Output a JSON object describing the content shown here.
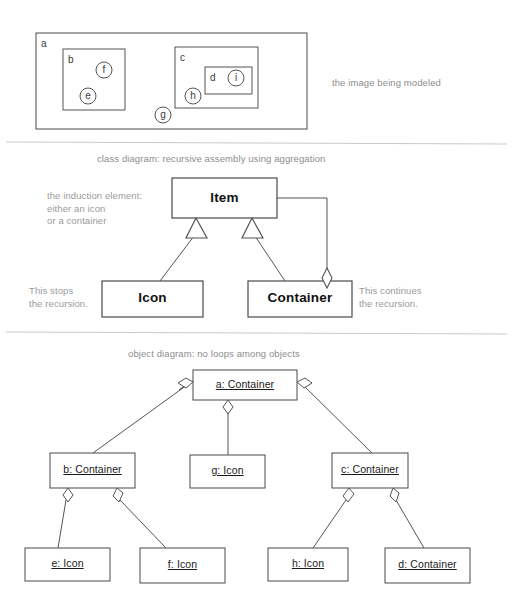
{
  "figure": {
    "background_color": "#ffffff",
    "line_color": "#4a4a4a",
    "caption_color": "#8d8d8d"
  },
  "panel_image": {
    "caption": "the image being modeled",
    "outer_box_label": "a",
    "boxes": [
      {
        "label": "a",
        "x": 36,
        "y": 33,
        "w": 271,
        "h": 96
      },
      {
        "label": "b",
        "x": 63,
        "y": 49,
        "w": 62,
        "h": 61
      },
      {
        "label": "c",
        "x": 175,
        "y": 47,
        "w": 83,
        "h": 61
      },
      {
        "label": "d",
        "x": 205,
        "y": 67,
        "w": 47,
        "h": 27
      }
    ],
    "circles": [
      {
        "label": "f",
        "cx": 104,
        "cy": 70,
        "r": 8
      },
      {
        "label": "e",
        "cx": 88,
        "cy": 96,
        "r": 8
      },
      {
        "label": "i",
        "cx": 236,
        "cy": 78,
        "r": 8
      },
      {
        "label": "h",
        "cx": 193,
        "cy": 96,
        "r": 8
      },
      {
        "label": "g",
        "cx": 163,
        "cy": 115,
        "r": 8
      }
    ]
  },
  "panel_class_diagram": {
    "caption": "class diagram: recursive assembly using aggregation",
    "notes": {
      "induction": "the induction element:\neither an icon\nor a container",
      "stops": "This stops\nthe recursion.",
      "continues": "This continues\nthe recursion."
    },
    "classes": [
      {
        "name": "Item",
        "x": 172,
        "y": 178,
        "w": 105,
        "h": 40
      },
      {
        "name": "Icon",
        "x": 102,
        "y": 281,
        "w": 101,
        "h": 36
      },
      {
        "name": "Container",
        "x": 248,
        "y": 281,
        "w": 104,
        "h": 36
      }
    ],
    "relationships": [
      {
        "type": "generalization",
        "from": "Icon",
        "to": "Item"
      },
      {
        "type": "generalization",
        "from": "Container",
        "to": "Item"
      },
      {
        "type": "aggregation",
        "from": "Item",
        "to": "Container",
        "diamond_end": "Container"
      }
    ]
  },
  "panel_object_diagram": {
    "caption": "object diagram: no loops among objects",
    "objects": [
      {
        "name": "a: Container",
        "x": 193,
        "y": 370,
        "w": 104,
        "h": 30,
        "level": 0
      },
      {
        "name": "b: Container",
        "x": 50,
        "y": 453,
        "w": 85,
        "h": 35,
        "level": 1
      },
      {
        "name": "g: Icon",
        "x": 190,
        "y": 455,
        "w": 75,
        "h": 33,
        "level": 1
      },
      {
        "name": "c: Container",
        "x": 332,
        "y": 453,
        "w": 76,
        "h": 35,
        "level": 1
      },
      {
        "name": "e: Icon",
        "x": 25,
        "y": 548,
        "w": 85,
        "h": 33,
        "level": 2
      },
      {
        "name": "f: Icon",
        "x": 140,
        "y": 548,
        "w": 85,
        "h": 35,
        "level": 2
      },
      {
        "name": "h: Icon",
        "x": 268,
        "y": 548,
        "w": 80,
        "h": 33,
        "level": 2
      },
      {
        "name": "d: Container",
        "x": 385,
        "y": 548,
        "w": 85,
        "h": 35,
        "level": 2
      }
    ],
    "links": [
      {
        "parent": "a: Container",
        "child": "b: Container",
        "type": "aggregation"
      },
      {
        "parent": "a: Container",
        "child": "g: Icon",
        "type": "aggregation"
      },
      {
        "parent": "a: Container",
        "child": "c: Container",
        "type": "aggregation"
      },
      {
        "parent": "b: Container",
        "child": "e: Icon",
        "type": "aggregation"
      },
      {
        "parent": "b: Container",
        "child": "f: Icon",
        "type": "aggregation"
      },
      {
        "parent": "c: Container",
        "child": "h: Icon",
        "type": "aggregation"
      },
      {
        "parent": "c: Container",
        "child": "d: Container",
        "type": "aggregation"
      }
    ]
  },
  "dividers": [
    {
      "y": 142
    },
    {
      "y": 332
    }
  ]
}
